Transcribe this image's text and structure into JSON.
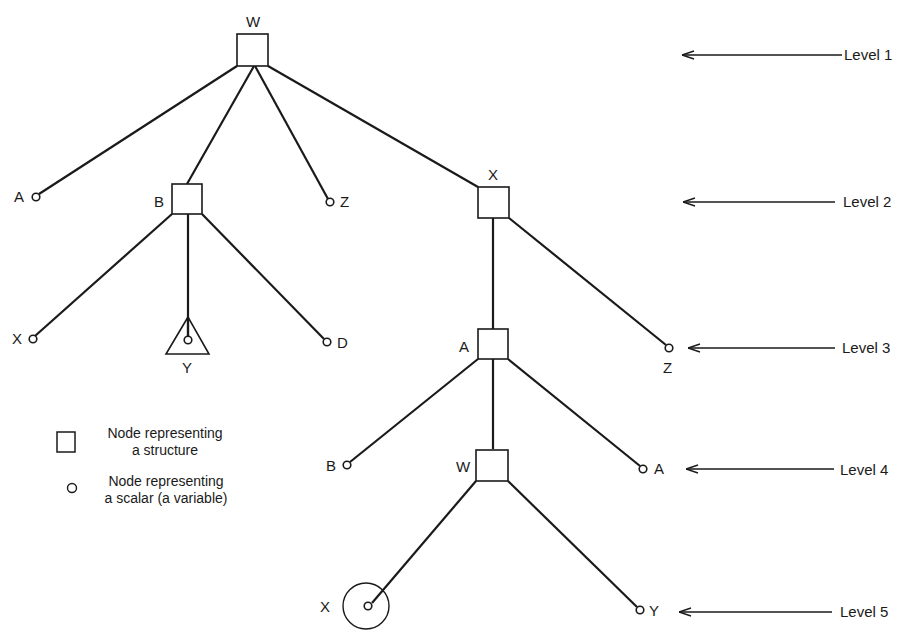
{
  "diagram": {
    "type": "tree",
    "stroke_color": "#1a1a1a",
    "background": "#ffffff",
    "nodes": {
      "w_root": {
        "label": "W",
        "kind": "structure",
        "level": 1
      },
      "a_l2": {
        "label": "A",
        "kind": "scalar",
        "level": 2
      },
      "b_l2": {
        "label": "B",
        "kind": "structure",
        "level": 2
      },
      "z_l2": {
        "label": "Z",
        "kind": "scalar",
        "level": 2
      },
      "x_l2": {
        "label": "X",
        "kind": "structure",
        "level": 2
      },
      "x_l3": {
        "label": "X",
        "kind": "scalar",
        "level": 3
      },
      "y_l3": {
        "label": "Y",
        "kind": "scalar-in-triangle",
        "level": 3
      },
      "d_l3": {
        "label": "D",
        "kind": "scalar",
        "level": 3
      },
      "a_l3": {
        "label": "A",
        "kind": "structure",
        "level": 3
      },
      "z_l3": {
        "label": "Z",
        "kind": "scalar",
        "level": 3
      },
      "b_l4": {
        "label": "B",
        "kind": "scalar",
        "level": 4
      },
      "w_l4": {
        "label": "W",
        "kind": "structure",
        "level": 4
      },
      "a_l4": {
        "label": "A",
        "kind": "scalar",
        "level": 4
      },
      "x_l5": {
        "label": "X",
        "kind": "scalar-circled",
        "level": 5
      },
      "y_l5": {
        "label": "Y",
        "kind": "scalar",
        "level": 5
      }
    },
    "edges": [
      [
        "w_root",
        "a_l2"
      ],
      [
        "w_root",
        "b_l2"
      ],
      [
        "w_root",
        "z_l2"
      ],
      [
        "w_root",
        "x_l2"
      ],
      [
        "b_l2",
        "x_l3"
      ],
      [
        "b_l2",
        "y_l3"
      ],
      [
        "b_l2",
        "d_l3"
      ],
      [
        "x_l2",
        "a_l3"
      ],
      [
        "x_l2",
        "z_l3"
      ],
      [
        "a_l3",
        "b_l4"
      ],
      [
        "a_l3",
        "w_l4"
      ],
      [
        "a_l3",
        "a_l4"
      ],
      [
        "w_l4",
        "x_l5"
      ],
      [
        "w_l4",
        "y_l5"
      ]
    ]
  },
  "levels": [
    {
      "label": "Level  1"
    },
    {
      "label": "Level  2"
    },
    {
      "label": "Level  3"
    },
    {
      "label": "Level  4"
    },
    {
      "label": "Level  5"
    }
  ],
  "legend": {
    "structure": {
      "line1": "Node representing",
      "line2": "a structure"
    },
    "scalar": {
      "line1": "Node representing",
      "line2": "a scalar (a variable)"
    }
  }
}
